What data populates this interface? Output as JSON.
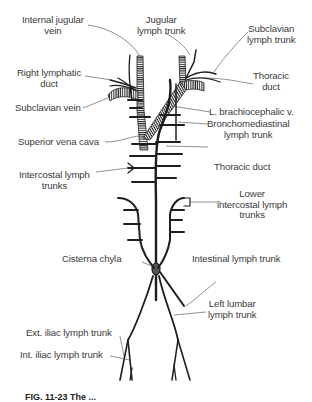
{
  "figure": {
    "caption": "FIG. 11-23  The ...",
    "labels": {
      "internal_jugular_vein": [
        "Internal jugular",
        "vein"
      ],
      "jugular_lymph_trunk": [
        "Jugular",
        "lymph trunk"
      ],
      "subclavian_lymph_trunk": [
        "Subclavian",
        "lymph trunk"
      ],
      "right_lymphatic_duct": [
        "Right lymphatic",
        "duct"
      ],
      "thoracic_duct_upper": [
        "Thoracic",
        "duct"
      ],
      "subclavian_vein": "Subclavian vein",
      "l_brachiocephalic_v": "L. brachiocephalic v.",
      "superior_vena_cava": "Superior vena cava",
      "bronchomediastinal_lymph_trunk": [
        "Bronchomediastinal",
        "lymph trunk"
      ],
      "thoracic_duct": "Thoracic duct",
      "intercostal_lymph_trunks": [
        "Intercostal lymph",
        "trunks"
      ],
      "lower_intercostal_lymph_trunks": [
        "Lower",
        "intercostal lymph",
        "trunks"
      ],
      "cisterna_chyla": "Cisterna chyla",
      "intestinal_lymph_trunk": "Intestinal lymph trunk",
      "left_lumbar_lymph_trunk": [
        "Left lumbar",
        "lymph trunk"
      ],
      "ext_iliac_lymph_trunk": "Ext. iliac lymph trunk",
      "int_iliac_lymph_trunk": "Int. iliac lymph trunk"
    }
  }
}
